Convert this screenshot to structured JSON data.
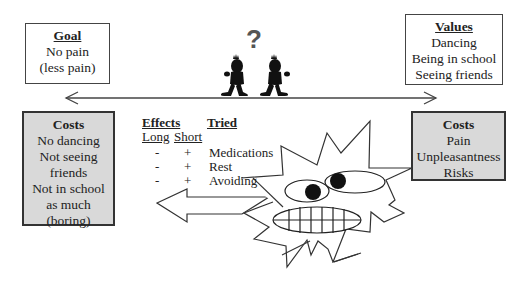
{
  "goal_box": {
    "title": "Goal",
    "lines": [
      "No pain",
      "(less pain)"
    ]
  },
  "values_box": {
    "title": "Values",
    "lines": [
      "Dancing",
      "Being in school",
      "Seeing friends"
    ]
  },
  "costs_left_box": {
    "title": "Costs",
    "lines": [
      "No dancing",
      "Not seeing",
      "friends",
      "Not in school",
      "as much",
      "(boring)"
    ]
  },
  "costs_right_box": {
    "title": "Costs",
    "lines": [
      "Pain",
      "Unpleasantness",
      "Risks"
    ]
  },
  "question_mark": "?",
  "table": {
    "effects_header": "Effects",
    "tried_header": "Tried",
    "long_header": "Long",
    "short_header": "Short",
    "rows": [
      {
        "long": "-",
        "short": "+",
        "tried": "Medications"
      },
      {
        "long": "-",
        "short": "+",
        "tried": "Rest"
      },
      {
        "long": "-",
        "short": "+",
        "tried": "Avoiding"
      }
    ]
  },
  "colors": {
    "gray_box": "#d9d9d9",
    "line": "#444444",
    "figure": "#111111"
  }
}
